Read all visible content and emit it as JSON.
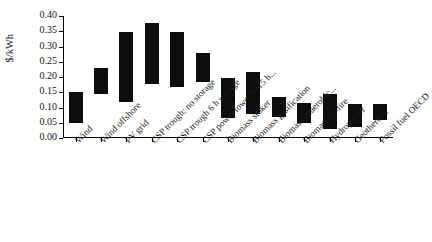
{
  "chart_data": {
    "type": "bar",
    "subtype": "floating-range-bar",
    "title": "",
    "xlabel": "",
    "ylabel": "$/kWh",
    "ylim": [
      0.0,
      0.4
    ],
    "ytick_labels": [
      "0.00",
      "0.05",
      "0.10",
      "0.15",
      "0.20",
      "0.25",
      "0.30",
      "0.35",
      "0.40"
    ],
    "ytick_values": [
      0.0,
      0.05,
      0.1,
      0.15,
      0.2,
      0.25,
      0.3,
      0.35,
      0.4
    ],
    "grid": false,
    "legend": "none",
    "categories": [
      "Wind",
      "Wind offshore",
      "PV grid",
      "CSP trough: no storage",
      "CSP trough 6 h storage",
      "CSP power tower 6–15 h...",
      "Biomass stoker",
      "Biomass gasification",
      "Biomass anaerobic...",
      "Biomass co-fire",
      "Hydropower",
      "Geothermal",
      "Fossil fuel OECD"
    ],
    "series": [
      {
        "name": "Levelised cost range",
        "low": [
          0.05,
          0.145,
          0.118,
          0.178,
          0.168,
          0.185,
          0.065,
          0.078,
          0.068,
          0.048,
          0.03,
          0.035,
          0.058
        ],
        "high": [
          0.15,
          0.228,
          0.348,
          0.378,
          0.348,
          0.278,
          0.198,
          0.218,
          0.135,
          0.115,
          0.145,
          0.112,
          0.112
        ]
      }
    ],
    "bar_color": "#0d0d0d"
  }
}
